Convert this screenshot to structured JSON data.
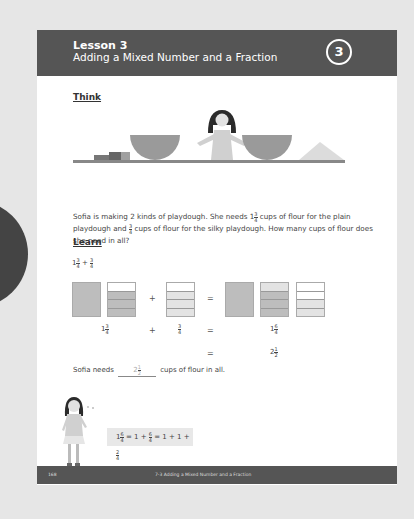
{
  "header": {
    "lesson_number": "Lesson 3",
    "lesson_title": "Adding a Mixed Number and a Fraction",
    "badge": "3"
  },
  "side_tab": {
    "page_number": "168"
  },
  "think": {
    "heading": "Think",
    "illustration": "girl-with-bowls-and-flour",
    "paragraph": {
      "part1": "Sofia is making 2 kinds of playdough. She needs 1",
      "frac1": {
        "num": "3",
        "den": "4"
      },
      "part2": " cups of flour for the plain playdough and ",
      "frac2": {
        "num": "3",
        "den": "4"
      },
      "part3": " cups of flour for the silky playdough. How many cups of flour does she need in all?"
    }
  },
  "learn": {
    "heading": "Learn",
    "expression": {
      "whole": "1",
      "frac1": {
        "num": "3",
        "den": "4"
      },
      "plus": "+",
      "frac2": {
        "num": "3",
        "den": "4"
      }
    },
    "operators": {
      "plus": "+",
      "equals": "="
    },
    "labels": {
      "left": {
        "whole": "1",
        "num": "3",
        "den": "4"
      },
      "middle": {
        "num": "3",
        "den": "4"
      },
      "right": {
        "whole": "1",
        "num": "6",
        "den": "4"
      },
      "simplified": {
        "whole": "2",
        "num": "1",
        "den": "2"
      }
    },
    "answer": {
      "before": "Sofia needs",
      "blank": {
        "whole": "2",
        "num": "1",
        "den": "2"
      },
      "after": "cups of flour in all."
    },
    "bubble": {
      "text_a": "1",
      "frac_a": {
        "num": "6",
        "den": "4"
      },
      "text_b": " = 1 + ",
      "frac_b": {
        "num": "6",
        "den": "4"
      },
      "text_c": " = 1 + 1 + ",
      "frac_c": {
        "num": "2",
        "den": "4"
      }
    }
  },
  "footer": {
    "page": "168",
    "title": "7-3  Adding a Mixed Number and a Fraction"
  },
  "colors": {
    "header_bg": "#555555",
    "tab_bg": "#444444",
    "shade_dark": "#bdbdbd",
    "shade_light": "#e3e3e3",
    "background": "#e6e6e6"
  }
}
